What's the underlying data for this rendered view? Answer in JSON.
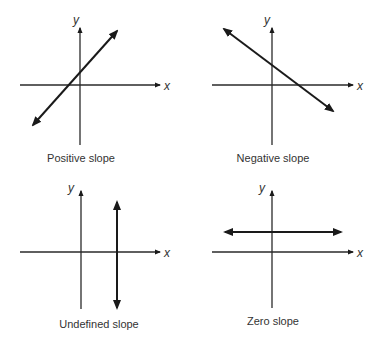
{
  "panels": [
    {
      "id": "positive",
      "caption": "Positive slope",
      "x_axis_label": "x",
      "y_axis_label": "y"
    },
    {
      "id": "negative",
      "caption": "Negative slope",
      "x_axis_label": "x",
      "y_axis_label": "y"
    },
    {
      "id": "undefined",
      "caption": "Undefined slope",
      "x_axis_label": "x",
      "y_axis_label": "y"
    },
    {
      "id": "zero",
      "caption": "Zero slope",
      "x_axis_label": "x",
      "y_axis_label": "y"
    }
  ],
  "colors": {
    "line": "#1a1a1a",
    "axis": "#2a2a2a",
    "text": "#333333",
    "background": "#ffffff"
  }
}
